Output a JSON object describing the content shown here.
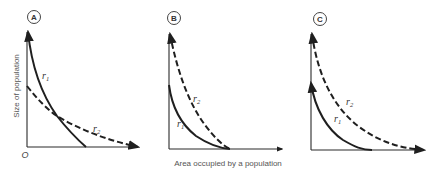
{
  "figure": {
    "y_axis_label": "Size of population",
    "x_axis_label": "Area occupied by a population",
    "origin_label": "O",
    "panels": [
      {
        "id": "A",
        "curves": [
          {
            "name": "r1",
            "label": "r",
            "subscript": "1",
            "style": "solid"
          },
          {
            "name": "r2",
            "label": "r",
            "subscript": "2",
            "style": "dashed"
          }
        ]
      },
      {
        "id": "B",
        "curves": [
          {
            "name": "r1",
            "label": "r",
            "subscript": "1",
            "style": "solid"
          },
          {
            "name": "r2",
            "label": "r",
            "subscript": "2",
            "style": "dashed"
          }
        ]
      },
      {
        "id": "C",
        "curves": [
          {
            "name": "r1",
            "label": "r",
            "subscript": "1",
            "style": "solid"
          },
          {
            "name": "r2",
            "label": "r",
            "subscript": "2",
            "style": "dashed"
          }
        ]
      }
    ]
  },
  "colors": {
    "line": "#1f1f1f",
    "text": "#555555",
    "background": "#ffffff"
  }
}
